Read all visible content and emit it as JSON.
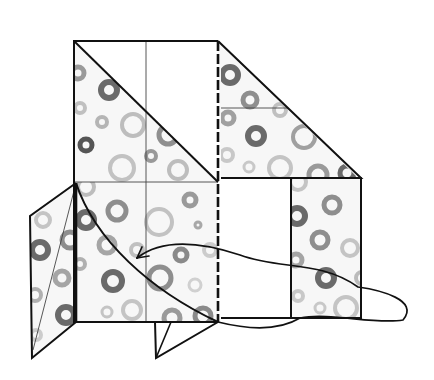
{
  "diagram": {
    "title": "Origami fold step",
    "type": "folding-diagram",
    "colors": {
      "line": "#111111",
      "paper": "#f7f7f7",
      "blank": "#ffffff",
      "ring_dark": "#6a6a6a",
      "ring_mid": "#8e8e8e",
      "ring_light": "#b9b9b9"
    },
    "panels": [
      {
        "name": "upper-left-square",
        "points": "74,41 218,41 218,182 74,182"
      },
      {
        "name": "lower-left-square",
        "points": "74,182 218,182 218,322 74,322"
      },
      {
        "name": "upper-right-triangle",
        "points": "218,41 361,178 221,178"
      },
      {
        "name": "right-lower-panel",
        "points": "291,178 361,178 361,318 291,318"
      },
      {
        "name": "left-flap",
        "points": "76,183 30,216 32,358 76,322"
      },
      {
        "name": "bottom-flap",
        "points": "155,322 218,322 156,358"
      }
    ],
    "fold_lines": [
      {
        "name": "diagonal-crease-top",
        "x1": 74,
        "y1": 41,
        "x2": 218,
        "y2": 182
      },
      {
        "name": "center-crease-vertical",
        "x1": 146,
        "y1": 41,
        "x2": 146,
        "y2": 322
      },
      {
        "name": "horizontal-crease-middle",
        "x1": 74,
        "y1": 182,
        "x2": 218,
        "y2": 182
      },
      {
        "name": "right-triangle-crease",
        "x1": 221,
        "y1": 108,
        "x2": 288,
        "y2": 108
      },
      {
        "name": "left-flap-crease",
        "x1": 76,
        "y1": 183,
        "x2": 32,
        "y2": 350
      }
    ],
    "valley_fold": {
      "name": "dashed-valley-fold",
      "x1": 218,
      "y1": 41,
      "x2": 218,
      "y2": 322
    },
    "arrow": {
      "name": "fold-direction-arrow",
      "path": "M 218 322 C 185 300, 150 285, 135 260 C 175 240, 200 245, 240 290 C 290 335, 340 330, 375 318 C 420 300, 395 290, 355 285",
      "head": {
        "x": 135,
        "y": 260
      }
    }
  }
}
